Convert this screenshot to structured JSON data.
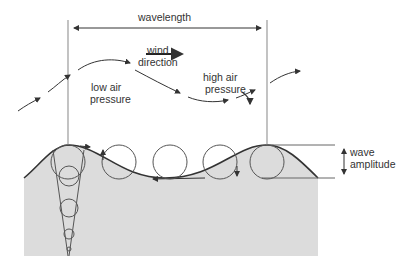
{
  "diagram": {
    "labels": {
      "wavelength": "wavelength",
      "wind_direction_line1": "wind",
      "wind_direction_line2": "direction",
      "low_pressure_line1": "low air",
      "low_pressure_line2": "pressure",
      "high_pressure_line1": "high air",
      "high_pressure_line2": "pressure",
      "amplitude_line1": "wave",
      "amplitude_line2": "amplitude"
    },
    "colors": {
      "water": "#dcdcdc",
      "line": "#333333",
      "guide": "#9a9a9a",
      "text": "#333333"
    }
  }
}
